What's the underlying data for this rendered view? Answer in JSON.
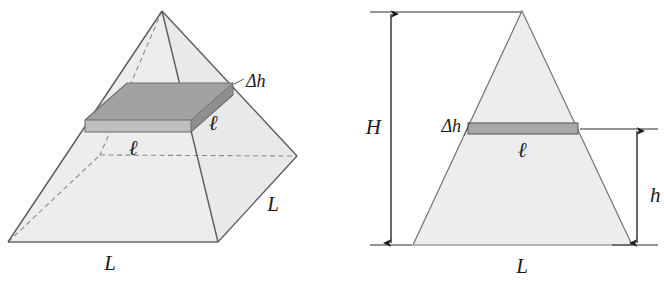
{
  "figure": {
    "panels": [
      {
        "id": "left-panel",
        "name": "pyramid-3d-view",
        "description": "Three-dimensional square pyramid with a thin horizontal slab",
        "labels": {
          "base_front": "L",
          "base_right": "L",
          "slab_thickness": "Δh",
          "slab_side_right": "ℓ",
          "slab_side_front": "ℓ"
        }
      },
      {
        "id": "right-panel",
        "name": "pyramid-cross-section-view",
        "description": "Two-dimensional cross-section triangle with dimension arrows",
        "labels": {
          "total_height": "H",
          "slab_height_above_base": "h",
          "slab_thickness": "Δh",
          "slab_width": "ℓ",
          "base_width": "L"
        }
      }
    ],
    "colors": {
      "outline": "#555555",
      "body_fill": "#ededed",
      "body_fill_shaded": "#e3e3e3",
      "slab_top": "#9d9d9d",
      "slab_front": "#bcbcbc",
      "slab_edge": "#6f6f6f",
      "arrow": "#1a1a1a",
      "text": "#1a1a1a"
    }
  }
}
